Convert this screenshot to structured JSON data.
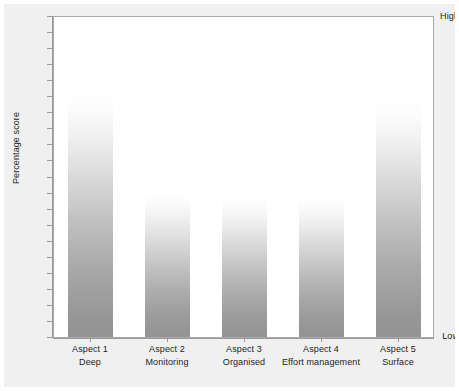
{
  "chart_data": {
    "type": "bar",
    "title": "",
    "subtitle": "",
    "xlabel": "",
    "ylabel": "Percentage score",
    "ylim": [
      0,
      100
    ],
    "y_axis_ticks": [
      "Low",
      "High"
    ],
    "y_tick_count": 21,
    "grid": false,
    "legend": null,
    "categories": [
      "Aspect 1",
      "Aspect 2",
      "Aspect 3",
      "Aspect 4",
      "Aspect 5"
    ],
    "category_sublabels": [
      "Deep",
      "Monitoring",
      "Organised",
      "Effort management",
      "Surface"
    ],
    "values": [
      76,
      45,
      44,
      44,
      74
    ],
    "bar_style": "vertical gradient, white at top to grey at bottom",
    "bar_color_top": "#ffffff",
    "bar_color_bottom": "#939393",
    "annotations": []
  },
  "axis": {
    "y_high_label": "High",
    "y_low_label": "Low",
    "y_title": "Percentage score"
  },
  "categories": [
    {
      "name": "Aspect 1",
      "sub": "Deep"
    },
    {
      "name": "Aspect 2",
      "sub": "Monitoring"
    },
    {
      "name": "Aspect 3",
      "sub": "Organised"
    },
    {
      "name": "Aspect 4",
      "sub": "Effort management"
    },
    {
      "name": "Aspect 5",
      "sub": "Surface"
    }
  ],
  "colors": {
    "figure_background": "#f0f0f0",
    "plot_background": "#ffffff",
    "frame_border": "#a9a9a9",
    "axis_line": "#9a9a9a",
    "text": "#1d1d1d",
    "bar_bottom": "#939393"
  }
}
